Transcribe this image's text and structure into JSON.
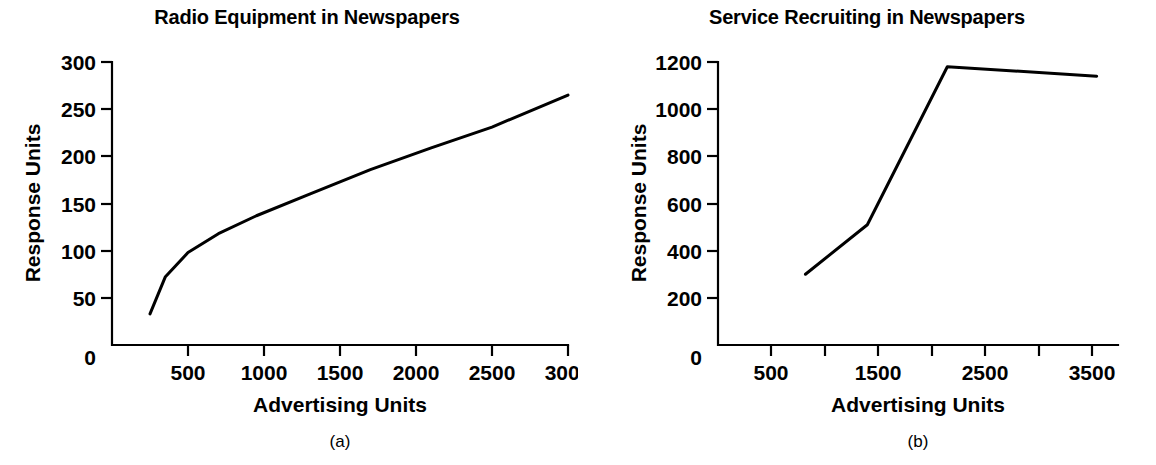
{
  "figure": {
    "background": "#ffffff",
    "ink_color": "#000000",
    "panel_count": 2
  },
  "panels": [
    {
      "id": "panel-a",
      "caption": "(a)",
      "chart_data": {
        "type": "line",
        "title": "Radio Equipment in Newspapers",
        "xlabel": "Advertising Units",
        "ylabel": "Response Units",
        "xlim": [
          0,
          3000
        ],
        "ylim": [
          0,
          300
        ],
        "grid": false,
        "legend": null,
        "x_ticks": [
          500,
          1000,
          1500,
          2000,
          2500,
          3000
        ],
        "x_tick_labels": [
          "500",
          "1000",
          "1500",
          "2000",
          "2500",
          "3000"
        ],
        "y_ticks": [
          50,
          100,
          150,
          200,
          250,
          300
        ],
        "y_tick_labels": [
          "50",
          "100",
          "150",
          "200",
          "250",
          "300"
        ],
        "origin_label": "0",
        "series": [
          {
            "name": "Radio Equipment",
            "x": [
              250,
              350,
              500,
              700,
              950,
              1300,
              1700,
              2100,
              2500,
              3000
            ],
            "y": [
              33,
              72,
              98,
              118,
              137,
              160,
              186,
              209,
              231,
              265
            ]
          }
        ]
      }
    },
    {
      "id": "panel-b",
      "caption": "(b)",
      "chart_data": {
        "type": "line",
        "title": "Service Recruiting in Newspapers",
        "xlabel": "Advertising Units",
        "ylabel": "Response Units",
        "xlim": [
          0,
          3750
        ],
        "ylim": [
          0,
          1200
        ],
        "grid": false,
        "legend": null,
        "x_ticks": [
          500,
          1000,
          1500,
          2000,
          2500,
          3000,
          3500
        ],
        "x_tick_labels": [
          "500",
          "",
          "1500",
          "",
          "2500",
          "",
          "3500"
        ],
        "y_ticks": [
          200,
          400,
          600,
          800,
          1000,
          1200
        ],
        "y_tick_labels": [
          "200",
          "400",
          "600",
          "800",
          "1000",
          "1200"
        ],
        "origin_label": "0",
        "series": [
          {
            "name": "Service Recruiting",
            "x": [
              820,
              1400,
              2150,
              3550
            ],
            "y": [
              300,
              510,
              1180,
              1140
            ]
          }
        ]
      }
    }
  ]
}
